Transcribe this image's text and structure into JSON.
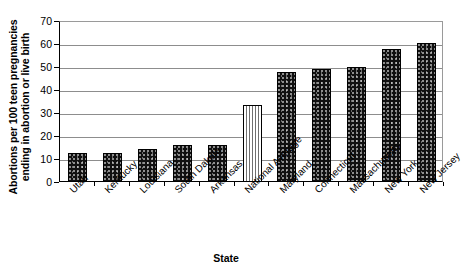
{
  "chart_data": {
    "type": "bar",
    "title": "",
    "xlabel": "State",
    "ylabel": "Abortions per 100 teen pregnancies ending in abortion or live birth",
    "ylabel_lines": [
      "Abortions per 100 teen pregnancies",
      "ending in abortion or live birth"
    ],
    "categories": [
      "Utah",
      "Kentucky",
      "Louisiana",
      "South Dakota",
      "Arkansas",
      "National Average",
      "Maryland",
      "Connecticut",
      "Massachusetts",
      "New York",
      "New Jersey"
    ],
    "values": [
      12.5,
      12.5,
      14.5,
      16,
      16,
      33.5,
      48,
      49,
      50,
      58,
      60.5
    ],
    "bar_styles": [
      "solid",
      "solid",
      "solid",
      "solid",
      "solid",
      "striped",
      "solid",
      "solid",
      "solid",
      "solid",
      "solid"
    ],
    "ylim": [
      0,
      70
    ],
    "ytick_values": [
      0,
      10,
      20,
      30,
      40,
      50,
      60,
      70
    ],
    "ytick_labels": [
      "0",
      "10",
      "20",
      "30",
      "40",
      "50",
      "60",
      "70"
    ],
    "grid": true,
    "legend": null,
    "colors": {
      "bar_solid": "#101010",
      "bar_striped": "#ffffff",
      "gridline": "#8d8d8d",
      "axis": "#000000",
      "background": "#ffffff"
    }
  }
}
